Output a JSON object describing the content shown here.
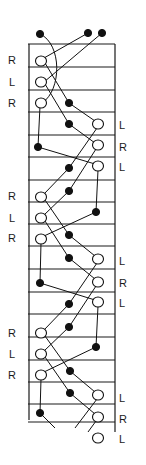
{
  "diagram": {
    "title": "",
    "frame": {
      "left": 29,
      "right": 115,
      "top": 44,
      "bottom_left": 420,
      "bottom_right": 432
    },
    "rungs": [
      44,
      67,
      90,
      112,
      135,
      157,
      180,
      202,
      224,
      246,
      269,
      292,
      314,
      337,
      360,
      382,
      404,
      422
    ],
    "left_labels": [
      {
        "text": "R",
        "x": 8,
        "y": 64
      },
      {
        "text": "L",
        "x": 9,
        "y": 86
      },
      {
        "text": "R",
        "x": 8,
        "y": 107
      },
      {
        "text": "R",
        "x": 8,
        "y": 200
      },
      {
        "text": "L",
        "x": 9,
        "y": 222
      },
      {
        "text": "R",
        "x": 8,
        "y": 242
      },
      {
        "text": "R",
        "x": 8,
        "y": 337
      },
      {
        "text": "L",
        "x": 9,
        "y": 358
      },
      {
        "text": "R",
        "x": 8,
        "y": 379
      }
    ],
    "right_labels": [
      {
        "text": "L",
        "x": 119,
        "y": 129
      },
      {
        "text": "R",
        "x": 119,
        "y": 151
      },
      {
        "text": "L",
        "x": 119,
        "y": 171
      },
      {
        "text": "L",
        "x": 119,
        "y": 265
      },
      {
        "text": "R",
        "x": 119,
        "y": 287
      },
      {
        "text": "L",
        "x": 119,
        "y": 307
      },
      {
        "text": "L",
        "x": 119,
        "y": 402
      },
      {
        "text": "R",
        "x": 119,
        "y": 423
      },
      {
        "text": "L",
        "x": 119,
        "y": 443
      }
    ],
    "nodes": [
      {
        "id": "t1",
        "type": "filled",
        "x": 40,
        "y": 34
      },
      {
        "id": "t2",
        "type": "filled",
        "x": 88,
        "y": 33
      },
      {
        "id": "t3",
        "type": "filled",
        "x": 102,
        "y": 33
      },
      {
        "id": "a1",
        "type": "open",
        "x": 41,
        "y": 61
      },
      {
        "id": "a2",
        "type": "open",
        "x": 41,
        "y": 82
      },
      {
        "id": "a3",
        "type": "open",
        "x": 41,
        "y": 103
      },
      {
        "id": "a4",
        "type": "filled",
        "x": 69,
        "y": 103
      },
      {
        "id": "a5",
        "type": "filled",
        "x": 69,
        "y": 124
      },
      {
        "id": "a6",
        "type": "open",
        "x": 98,
        "y": 124
      },
      {
        "id": "a7",
        "type": "filled",
        "x": 38,
        "y": 147
      },
      {
        "id": "a8",
        "type": "open",
        "x": 98,
        "y": 145
      },
      {
        "id": "a9",
        "type": "filled",
        "x": 69,
        "y": 168
      },
      {
        "id": "a10",
        "type": "open",
        "x": 98,
        "y": 166
      },
      {
        "id": "a11",
        "type": "filled",
        "x": 69,
        "y": 191
      },
      {
        "id": "a12",
        "type": "filled",
        "x": 96,
        "y": 212
      },
      {
        "id": "b1",
        "type": "open",
        "x": 41,
        "y": 197
      },
      {
        "id": "b2",
        "type": "open",
        "x": 41,
        "y": 218
      },
      {
        "id": "b3",
        "type": "open",
        "x": 41,
        "y": 239
      },
      {
        "id": "b4",
        "type": "filled",
        "x": 69,
        "y": 235
      },
      {
        "id": "b5",
        "type": "filled",
        "x": 69,
        "y": 258
      },
      {
        "id": "b6",
        "type": "open",
        "x": 98,
        "y": 259
      },
      {
        "id": "b7",
        "type": "filled",
        "x": 40,
        "y": 283
      },
      {
        "id": "b8",
        "type": "open",
        "x": 98,
        "y": 282
      },
      {
        "id": "b9",
        "type": "filled",
        "x": 69,
        "y": 304
      },
      {
        "id": "b10",
        "type": "open",
        "x": 98,
        "y": 302
      },
      {
        "id": "b11",
        "type": "filled",
        "x": 69,
        "y": 327
      },
      {
        "id": "b12",
        "type": "filled",
        "x": 96,
        "y": 347
      },
      {
        "id": "c1",
        "type": "open",
        "x": 41,
        "y": 333
      },
      {
        "id": "c2",
        "type": "open",
        "x": 41,
        "y": 354
      },
      {
        "id": "c3",
        "type": "open",
        "x": 41,
        "y": 375
      },
      {
        "id": "c4",
        "type": "filled",
        "x": 70,
        "y": 371
      },
      {
        "id": "c5",
        "type": "filled",
        "x": 70,
        "y": 393
      },
      {
        "id": "c6",
        "type": "open",
        "x": 98,
        "y": 395
      },
      {
        "id": "c7",
        "type": "filled",
        "x": 40,
        "y": 413
      },
      {
        "id": "c8",
        "type": "open",
        "x": 98,
        "y": 417
      },
      {
        "id": "c10",
        "type": "open",
        "x": 98,
        "y": 438
      }
    ],
    "edges": [
      {
        "path": "M40,34 C62,44 62,90 42,103"
      },
      {
        "path": "M88,33 L44,58"
      },
      {
        "path": "M102,33 L44,82"
      },
      {
        "path": "M45,63 L69,103"
      },
      {
        "path": "M45,84 L69,124"
      },
      {
        "path": "M69,103 L95,121"
      },
      {
        "path": "M69,124 L95,143"
      },
      {
        "path": "M40,106 L38,147"
      },
      {
        "path": "M38,147 L95,164"
      },
      {
        "path": "M69,124 L69,124"
      },
      {
        "path": "M97,128 L69,168"
      },
      {
        "path": "M96,149 L69,191"
      },
      {
        "path": "M69,168 L44,194"
      },
      {
        "path": "M69,191 L44,215"
      },
      {
        "path": "M98,170 L96,212"
      },
      {
        "path": "M96,212 L44,236"
      },
      {
        "path": "M45,200 L69,235"
      },
      {
        "path": "M45,221 L69,258"
      },
      {
        "path": "M69,235 L95,256"
      },
      {
        "path": "M69,258 L95,279"
      },
      {
        "path": "M41,243 L40,283"
      },
      {
        "path": "M40,283 L95,300"
      },
      {
        "path": "M97,263 L69,304"
      },
      {
        "path": "M96,286 L69,327"
      },
      {
        "path": "M69,304 L44,330"
      },
      {
        "path": "M69,327 L44,351"
      },
      {
        "path": "M98,306 L96,347"
      },
      {
        "path": "M96,347 L44,372"
      },
      {
        "path": "M45,336 L70,371"
      },
      {
        "path": "M45,357 L70,393"
      },
      {
        "path": "M70,371 L95,392"
      },
      {
        "path": "M70,393 L95,414"
      },
      {
        "path": "M41,379 L40,413"
      },
      {
        "path": "M40,413 L55,428"
      },
      {
        "path": "M97,399 L75,428"
      },
      {
        "path": "M96,421 L88,432"
      }
    ]
  }
}
